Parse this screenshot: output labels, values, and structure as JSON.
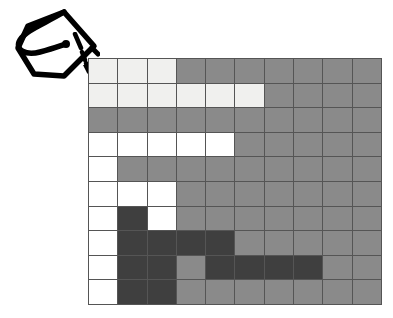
{
  "image": {
    "kind": "hand-annotated-raster-grid-diagram",
    "background_color": "#ffffff",
    "width": 393,
    "height": 318
  },
  "annotation": {
    "mark_name": "hand-drawn-loop-square",
    "mark_description": "hand drawn tilted square with looping tail, drawn in thick black ink",
    "mark_stroke_color": "#000000",
    "pointer_name": "dashed-arrow",
    "pointer_description": "short dashed arrow pointing down-right from the drawn mark to the top-left corner of the grid",
    "pointer_color": "#000000"
  },
  "grid": {
    "name": "pixel-grid",
    "columns": 10,
    "rows": 10,
    "line_color": "#555555",
    "palette": {
      "white": "#ffffff",
      "light": "#f0f0ee",
      "gray": "#8a8a8a",
      "dark": "#3f3f3f"
    },
    "legend": [
      {
        "key": "white",
        "label": "white",
        "color": "#ffffff"
      },
      {
        "key": "light",
        "label": "light",
        "color": "#f0f0ee"
      },
      {
        "key": "gray",
        "label": "gray",
        "color": "#8a8a8a"
      },
      {
        "key": "dark",
        "label": "dark",
        "color": "#3f3f3f"
      }
    ],
    "cells": [
      [
        "light",
        "light",
        "light",
        "gray",
        "gray",
        "gray",
        "gray",
        "gray",
        "gray",
        "gray"
      ],
      [
        "light",
        "light",
        "light",
        "light",
        "light",
        "light",
        "gray",
        "gray",
        "gray",
        "gray"
      ],
      [
        "gray",
        "gray",
        "gray",
        "gray",
        "gray",
        "gray",
        "gray",
        "gray",
        "gray",
        "gray"
      ],
      [
        "white",
        "white",
        "white",
        "white",
        "white",
        "gray",
        "gray",
        "gray",
        "gray",
        "gray"
      ],
      [
        "white",
        "gray",
        "gray",
        "gray",
        "gray",
        "gray",
        "gray",
        "gray",
        "gray",
        "gray"
      ],
      [
        "white",
        "white",
        "white",
        "gray",
        "gray",
        "gray",
        "gray",
        "gray",
        "gray",
        "gray"
      ],
      [
        "white",
        "dark",
        "white",
        "gray",
        "gray",
        "gray",
        "gray",
        "gray",
        "gray",
        "gray"
      ],
      [
        "white",
        "dark",
        "dark",
        "dark",
        "dark",
        "gray",
        "gray",
        "gray",
        "gray",
        "gray"
      ],
      [
        "white",
        "dark",
        "dark",
        "gray",
        "dark",
        "dark",
        "dark",
        "dark",
        "gray",
        "gray"
      ],
      [
        "white",
        "dark",
        "dark",
        "gray",
        "gray",
        "gray",
        "gray",
        "gray",
        "gray",
        "gray"
      ]
    ]
  }
}
